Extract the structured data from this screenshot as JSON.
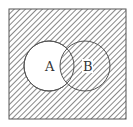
{
  "diagram": {
    "type": "venn",
    "universe": {
      "x": 9,
      "y": 9,
      "width": 117,
      "height": 110
    },
    "sets": [
      {
        "label": "A",
        "cx": 49,
        "cy": 66,
        "r": 25,
        "shaded": false
      },
      {
        "label": "B",
        "cx": 85,
        "cy": 66,
        "r": 25,
        "shaded": true
      }
    ],
    "shaded_region": "complement of (A minus B)",
    "colors": {
      "stroke": "#555555",
      "hatch": "#6a6a6a",
      "background": "#ffffff"
    }
  }
}
